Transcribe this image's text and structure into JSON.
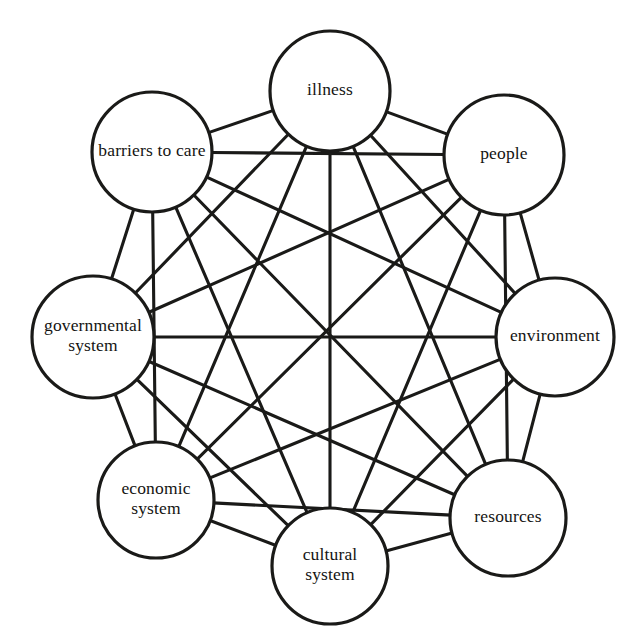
{
  "diagram": {
    "type": "complete-graph",
    "canvas": {
      "width": 641,
      "height": 644
    },
    "style": {
      "background_color": "#ffffff",
      "node_fill": "#ffffff",
      "node_stroke": "#1a1a18",
      "node_stroke_width": 3.2,
      "edge_stroke": "#1a1a18",
      "edge_stroke_width": 3.1,
      "label_color": "#141412",
      "label_font_size": 17.5
    },
    "nodes": [
      {
        "id": "illness",
        "label": "illness",
        "lines": [
          "illness"
        ],
        "cx": 330,
        "cy": 91,
        "r": 60
      },
      {
        "id": "people",
        "label": "people",
        "lines": [
          "people"
        ],
        "cx": 504,
        "cy": 155,
        "r": 60
      },
      {
        "id": "environment",
        "label": "environment",
        "lines": [
          "environment"
        ],
        "cx": 555,
        "cy": 337,
        "r": 59
      },
      {
        "id": "resources",
        "label": "resources",
        "lines": [
          "resources"
        ],
        "cx": 508,
        "cy": 518,
        "r": 58
      },
      {
        "id": "cultural",
        "label": "cultural system",
        "lines": [
          "cultural",
          "system"
        ],
        "cx": 330,
        "cy": 566,
        "r": 58
      },
      {
        "id": "economic",
        "label": "economic system",
        "lines": [
          "economic",
          "system"
        ],
        "cx": 156,
        "cy": 500,
        "r": 58
      },
      {
        "id": "governmental",
        "label": "governmental system",
        "lines": [
          "governmental",
          "system"
        ],
        "cx": 93,
        "cy": 337,
        "r": 61
      },
      {
        "id": "barriers",
        "label": "barriers to care",
        "lines": [
          "barriers to care"
        ],
        "cx": 152,
        "cy": 152,
        "r": 60
      }
    ],
    "edges": [
      {
        "from": "illness",
        "to": "people"
      },
      {
        "from": "illness",
        "to": "environment"
      },
      {
        "from": "illness",
        "to": "resources"
      },
      {
        "from": "illness",
        "to": "cultural"
      },
      {
        "from": "illness",
        "to": "economic"
      },
      {
        "from": "illness",
        "to": "governmental"
      },
      {
        "from": "illness",
        "to": "barriers"
      },
      {
        "from": "people",
        "to": "environment"
      },
      {
        "from": "people",
        "to": "resources"
      },
      {
        "from": "people",
        "to": "cultural"
      },
      {
        "from": "people",
        "to": "economic"
      },
      {
        "from": "people",
        "to": "governmental"
      },
      {
        "from": "people",
        "to": "barriers"
      },
      {
        "from": "environment",
        "to": "resources"
      },
      {
        "from": "environment",
        "to": "cultural"
      },
      {
        "from": "environment",
        "to": "economic"
      },
      {
        "from": "environment",
        "to": "governmental"
      },
      {
        "from": "environment",
        "to": "barriers"
      },
      {
        "from": "resources",
        "to": "cultural"
      },
      {
        "from": "resources",
        "to": "economic"
      },
      {
        "from": "resources",
        "to": "governmental"
      },
      {
        "from": "resources",
        "to": "barriers"
      },
      {
        "from": "cultural",
        "to": "economic"
      },
      {
        "from": "cultural",
        "to": "governmental"
      },
      {
        "from": "cultural",
        "to": "barriers"
      },
      {
        "from": "economic",
        "to": "governmental"
      },
      {
        "from": "economic",
        "to": "barriers"
      },
      {
        "from": "governmental",
        "to": "barriers"
      }
    ],
    "edge_count": 28,
    "node_count": 8
  }
}
